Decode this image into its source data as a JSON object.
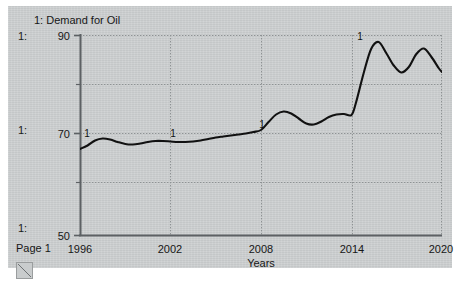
{
  "window": {
    "background_color": "#ffffff",
    "panel_color": "#c9cccd"
  },
  "legend": {
    "series_marker": "1:",
    "series_label": "1: Demand for Oil"
  },
  "axis_side_labels": [
    {
      "text": "1:",
      "value": 90
    },
    {
      "text": "1:",
      "value": 70
    },
    {
      "text": "1:",
      "value": 50
    }
  ],
  "footer": {
    "page_label": "Page 1",
    "resize_handle": "resize-grip-icon"
  },
  "chart_data": {
    "type": "line",
    "title": "1: Demand for Oil",
    "xlabel": "Years",
    "ylabel": "",
    "xlim": [
      1996,
      2020
    ],
    "ylim": [
      50,
      90
    ],
    "xticks": [
      1996,
      2002,
      2008,
      2014,
      2020
    ],
    "yticks": [
      50,
      70,
      90
    ],
    "gridlines_y": [
      60,
      80
    ],
    "grid": true,
    "legend_position": "top-left",
    "line_color": "#111111",
    "series": [
      {
        "name": "1: Demand for Oil",
        "annotations": [
          {
            "label": "1",
            "x": 1996.4,
            "y": 69.3
          },
          {
            "label": "1",
            "x": 2002.1,
            "y": 69.2
          },
          {
            "label": "1",
            "x": 2008.0,
            "y": 71.0
          },
          {
            "label": "1",
            "x": 2014.5,
            "y": 88.6
          }
        ],
        "x": [
          1996,
          1996.5,
          1997,
          1997.5,
          1998,
          1998.5,
          1999,
          1999.5,
          2000,
          2000.5,
          2001,
          2001.5,
          2002,
          2002.5,
          2003,
          2003.5,
          2004,
          2004.5,
          2005,
          2005.5,
          2006,
          2006.5,
          2007,
          2007.5,
          2008,
          2008.5,
          2009,
          2009.5,
          2010,
          2010.5,
          2011,
          2011.5,
          2012,
          2012.5,
          2013,
          2013.5,
          2014,
          2014.3,
          2014.8,
          2015.3,
          2015.8,
          2016.3,
          2016.8,
          2017.3,
          2017.8,
          2018.3,
          2018.8,
          2019.3,
          2019.8,
          2020
        ],
        "y": [
          67.2,
          67.9,
          68.9,
          69.3,
          69.1,
          68.6,
          68.2,
          68.1,
          68.3,
          68.6,
          68.8,
          68.8,
          68.7,
          68.6,
          68.6,
          68.7,
          68.9,
          69.2,
          69.5,
          69.7,
          69.9,
          70.1,
          70.3,
          70.6,
          71.0,
          72.6,
          74.1,
          74.7,
          74.3,
          73.3,
          72.3,
          72.1,
          72.7,
          73.6,
          74.1,
          74.2,
          74.0,
          76.5,
          82.3,
          87.2,
          88.6,
          86.4,
          83.9,
          82.5,
          83.6,
          86.2,
          87.3,
          85.6,
          83.3,
          82.6
        ]
      }
    ]
  }
}
